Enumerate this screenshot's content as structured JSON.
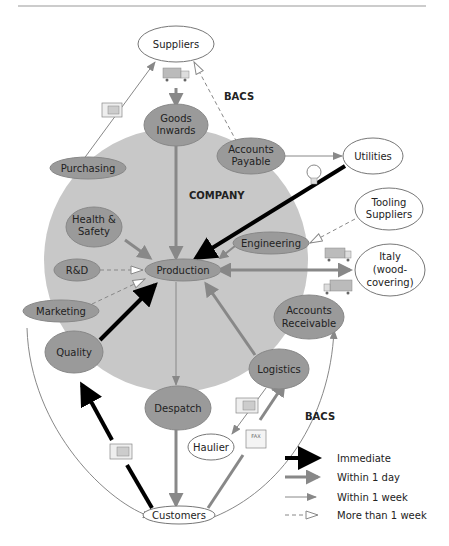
{
  "diagram": {
    "company_label": "COMPANY",
    "bacs_top": "BACS",
    "bacs_bottom": "BACS",
    "nodes": {
      "suppliers": "Suppliers",
      "goods_inwards_1": "Goods",
      "goods_inwards_2": "Inwards",
      "accounts_payable_1": "Accounts",
      "accounts_payable_2": "Payable",
      "utilities": "Utilities",
      "purchasing": "Purchasing",
      "tooling_1": "Tooling",
      "tooling_2": "Suppliers",
      "health_1": "Health &",
      "health_2": "Safety",
      "engineering": "Engineering",
      "rnd": "R&D",
      "production": "Production",
      "italy_1": "Italy",
      "italy_2": "(wood-",
      "italy_3": "covering)",
      "marketing": "Marketing",
      "accounts_rec_1": "Accounts",
      "accounts_rec_2": "Receivable",
      "quality": "Quality",
      "logistics": "Logistics",
      "despatch": "Despatch",
      "haulier": "Haulier",
      "customers": "Customers"
    },
    "fax_label": "FAX",
    "legend": [
      {
        "label": "Immediate",
        "style": "immediate"
      },
      {
        "label": "Within 1 day",
        "style": "day"
      },
      {
        "label": "Within 1 week",
        "style": "week"
      },
      {
        "label": "More than 1 week",
        "style": "more"
      }
    ],
    "colors": {
      "company_fill": "#c8c8c8",
      "dept_fill": "#9a9a9a",
      "arrow_day": "#8a8a8a",
      "arrow_immediate": "#000000"
    }
  }
}
